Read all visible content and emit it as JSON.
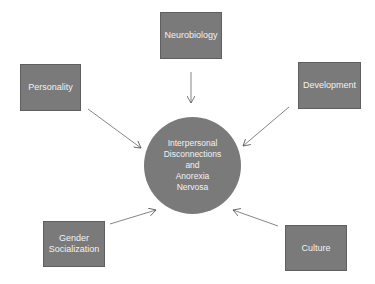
{
  "diagram": {
    "center": {
      "label": "Interpersonal\nDisconnections\nand\nAnorexia\nNervosa",
      "fill": "#7a7a7a"
    },
    "nodes": [
      {
        "id": "neurobiology",
        "label": "Neurobiology"
      },
      {
        "id": "personality",
        "label": "Personality"
      },
      {
        "id": "development",
        "label": "Development"
      },
      {
        "id": "gender-socialization",
        "label": "Gender\nSocialization"
      },
      {
        "id": "culture",
        "label": "Culture"
      }
    ],
    "edges": [
      {
        "from": "neurobiology",
        "to": "center"
      },
      {
        "from": "personality",
        "to": "center"
      },
      {
        "from": "development",
        "to": "center"
      },
      {
        "from": "gender-socialization",
        "to": "center"
      },
      {
        "from": "culture",
        "to": "center"
      }
    ],
    "colors": {
      "box_fill": "#7a7a7a",
      "text": "#f2f2f2",
      "arrow": "#555555"
    }
  }
}
